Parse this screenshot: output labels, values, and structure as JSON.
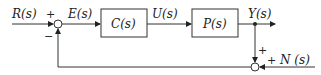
{
  "diagram": {
    "type": "feedback-block-diagram",
    "signals": {
      "input": "R(s)",
      "error": "E(s)",
      "control": "U(s)",
      "output": "Y(s)",
      "noise": "N (s)"
    },
    "blocks": [
      {
        "id": "controller",
        "label": "C(s)"
      },
      {
        "id": "plant",
        "label": "P(s)"
      }
    ],
    "summing_junction_1": {
      "plus_sign": "+",
      "minus_sign": "−"
    },
    "summing_junction_2": {
      "plus_top": "+",
      "plus_right": "+"
    }
  }
}
